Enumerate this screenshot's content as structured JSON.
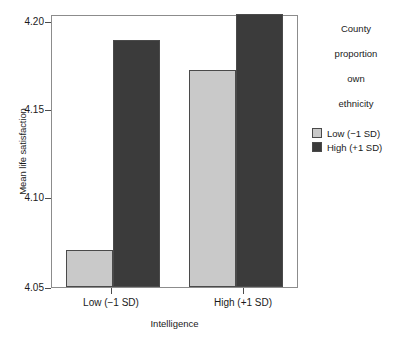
{
  "chart_data": {
    "type": "bar",
    "title": "",
    "xlabel": "Intelligence",
    "ylabel": "Mean life satisfaction",
    "categories": [
      "Low (−1 SD)",
      "High (+1 SD)"
    ],
    "series": [
      {
        "name": "Low (−1 SD)",
        "color": "#c9c9c9",
        "values": [
          4.071,
          4.174
        ]
      },
      {
        "name": "High (+1 SD)",
        "color": "#3b3b3b",
        "values": [
          4.191,
          4.206
        ]
      }
    ],
    "ylim": [
      4.05,
      4.205
    ],
    "yticks": [
      4.05,
      4.1,
      4.15,
      4.2
    ],
    "ytick_labels": [
      "4.05",
      "4.10",
      "4.15",
      "4.20"
    ],
    "grid": false,
    "legend_position": "right",
    "legend_title": "County\nproportion\nown\nethnicity"
  },
  "axes": {
    "y_title": "Mean life satisfaction",
    "x_title": "Intelligence",
    "y_ticks": [
      {
        "value": 4.2,
        "label": "4.20"
      },
      {
        "value": 4.15,
        "label": "4.15"
      },
      {
        "value": 4.1,
        "label": "4.10"
      },
      {
        "value": 4.05,
        "label": "4.05"
      }
    ],
    "x_ticks": [
      {
        "label": "Low (−1 SD)"
      },
      {
        "label": "High (+1 SD)"
      }
    ]
  },
  "legend": {
    "title_lines": [
      "County",
      "proportion",
      "own",
      "ethnicity"
    ],
    "title": "County\nproportion\nown\nethnicity",
    "items": [
      {
        "label": "Low (−1 SD)",
        "color": "#c9c9c9"
      },
      {
        "label": "High (+1 SD)",
        "color": "#3b3b3b"
      }
    ]
  },
  "colors": {
    "low_proportion": "#c9c9c9",
    "high_proportion": "#3b3b3b",
    "axis": "#8c8c8c",
    "text": "#1a1a1a",
    "background": "#ffffff"
  }
}
